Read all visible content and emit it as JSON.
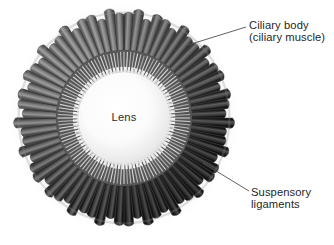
{
  "figure": {
    "background_color": "#ffffff",
    "width": 334,
    "height": 245
  },
  "labels": {
    "ciliary_body": {
      "line1": "Ciliary body",
      "line2": "(ciliary muscle)",
      "color": "#1f1f1f",
      "leader": {
        "x1": 188,
        "y1": 45,
        "x2": 246,
        "y2": 27
      }
    },
    "suspensory_ligaments": {
      "line1": "Suspensory",
      "line2": "ligaments",
      "color": "#1f1f1f",
      "leader": {
        "x1": 203,
        "y1": 163,
        "x2": 249,
        "y2": 191
      }
    },
    "lens": {
      "text": "Lens",
      "color": "#2b2b2b"
    }
  },
  "geometry": {
    "center_x": 124,
    "center_y": 118,
    "outer_radius": 106,
    "muscle_outer_radius": 104,
    "muscle_inner_radius": 66,
    "zonule_outer_radius": 66,
    "zonule_inner_radius": 47,
    "lens_radius": 46,
    "process_count": 68,
    "zonule_fiber_count": 120
  },
  "colors": {
    "muscle_dark": "#4a4a4a",
    "muscle_mid": "#7d7d7d",
    "muscle_light": "#b9b9b9",
    "muscle_edge": "#2e2e2e",
    "zonule_band": "#6d6d6d",
    "zonule_fiber": "#f2f2f2",
    "lens_center": "#ffffff",
    "lens_rim": "#d8d8d8",
    "shadow": "#c9c9c9",
    "leader_line": "#4f4f4f"
  }
}
